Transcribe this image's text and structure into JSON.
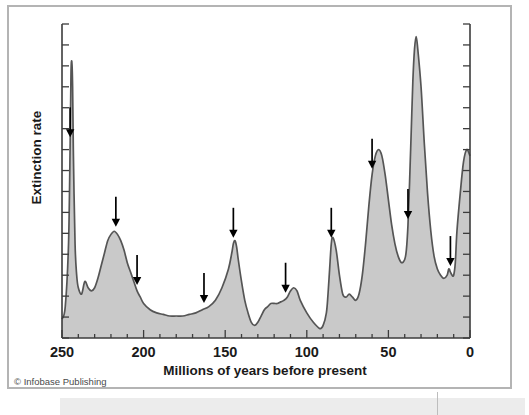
{
  "figure": {
    "credit": "© Infobase Publishing",
    "background_color": "#ffffff",
    "frame_color": "#b4b4b4"
  },
  "chart_data": {
    "type": "area",
    "title": "",
    "subtitle": "",
    "xlabel": "Millions of years before present",
    "ylabel": "Extinction rate",
    "xlim": [
      250,
      0
    ],
    "ylim": [
      0,
      100
    ],
    "x_reversed": true,
    "grid": false,
    "legend": null,
    "xticks": [
      250,
      200,
      150,
      100,
      50,
      0
    ],
    "xtick_labels": [
      "250",
      "200",
      "150",
      "100",
      "50",
      "0"
    ],
    "x_minor_tick_interval": 10,
    "yticks_unlabeled_count": 15,
    "y_axis_has_labels": false,
    "fill_color": "#c9c9c9",
    "line_color": "#555555",
    "series_name": "Extinction rate",
    "x": [
      250,
      248,
      246,
      245,
      244.5,
      244,
      243.5,
      243,
      242,
      241,
      240,
      238,
      236,
      234,
      232,
      230,
      228,
      226,
      224,
      222,
      220,
      218,
      216,
      214,
      212,
      210,
      208,
      206,
      204,
      202,
      200,
      196,
      192,
      188,
      184,
      180,
      176,
      172,
      168,
      164,
      160,
      156,
      152,
      148,
      146,
      145,
      144,
      143,
      142,
      140,
      138,
      136,
      134,
      132,
      130,
      128,
      126,
      124,
      122,
      120,
      118,
      116,
      114,
      112,
      110,
      108,
      106,
      104,
      100,
      96,
      92,
      90,
      88,
      87,
      86,
      85,
      84,
      82,
      80,
      78,
      76,
      74,
      72,
      70,
      68,
      66,
      64,
      62,
      60,
      58,
      56,
      54,
      52,
      50,
      48,
      46,
      44,
      42,
      40,
      39,
      38,
      37,
      36,
      35,
      34,
      33,
      32,
      30,
      28,
      26,
      24,
      22,
      20,
      18,
      16,
      14,
      13,
      12,
      11,
      10,
      9,
      8,
      6,
      4,
      2,
      0
    ],
    "y": [
      6,
      10,
      30,
      62,
      84,
      88,
      80,
      58,
      30,
      20,
      16,
      14,
      18,
      16,
      15,
      16,
      19,
      23,
      27,
      31,
      33,
      34,
      33,
      31,
      28,
      24,
      21,
      18,
      15,
      13,
      11,
      9,
      8,
      7.5,
      7,
      7,
      7,
      7.5,
      8,
      9,
      10,
      12,
      16,
      22,
      27,
      30,
      31,
      29,
      25,
      18,
      12,
      8,
      5,
      4,
      5,
      7,
      9,
      10,
      11,
      11,
      11,
      11.5,
      12,
      13,
      15,
      16,
      15,
      12,
      8,
      5,
      3,
      4,
      8,
      14,
      22,
      30,
      32,
      28,
      20,
      14,
      13,
      14,
      13,
      12,
      14,
      20,
      30,
      42,
      52,
      58,
      60,
      58,
      52,
      44,
      36,
      30,
      26,
      24,
      25,
      28,
      36,
      50,
      66,
      82,
      92,
      96,
      92,
      80,
      62,
      46,
      34,
      26,
      22,
      20,
      19,
      20,
      22,
      21,
      20,
      20,
      24,
      34,
      46,
      56,
      60,
      58,
      50,
      38,
      24,
      12,
      5,
      2
    ],
    "annotations": {
      "marker_type": "down-arrow",
      "description": "Downward arrows mark mass extinction events",
      "arrows_at_x": [
        245,
        217,
        204,
        163,
        145,
        113,
        85,
        60,
        38,
        12
      ],
      "count": 10
    }
  }
}
